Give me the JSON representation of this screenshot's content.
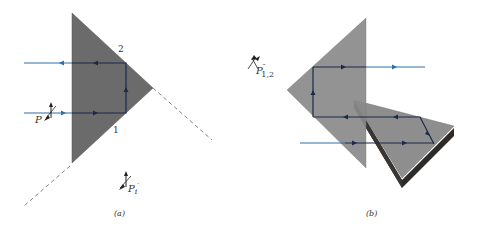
{
  "figure": {
    "panel_a": {
      "caption": "(a)",
      "face_labels": [
        "2",
        "1"
      ],
      "input_polarization_label": "P",
      "input_polarization_sub": "i",
      "output_polarization_label": "P",
      "output_polarization_sub": "i",
      "output_polarization_prime": "′"
    },
    "panel_b": {
      "caption": "(b)",
      "polarization_label": "P",
      "polarization_sub": "1,2",
      "polarization_prime": "″"
    },
    "colors": {
      "prism_fill": "#6b6b6b",
      "prism_b_fill": "#8a8a8a",
      "mirror_dark": "#2e2a28",
      "beam_outside": "#2f6fa8",
      "beam_inside": "#1b2a4a",
      "dashed_line": "#666666"
    }
  }
}
